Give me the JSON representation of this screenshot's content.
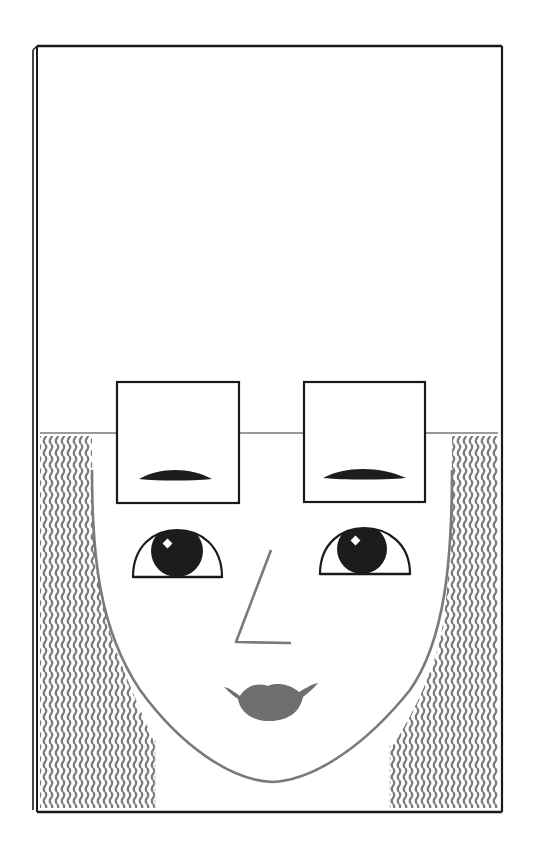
{
  "illustration": {
    "subject": "stylized face portrait",
    "colors": {
      "background": "#ffffff",
      "frame": "#1a1a1a",
      "hair": "#7a7a7a",
      "face_outline": "#7a7a7a",
      "lips": "#6f6f6f",
      "nose": "#7a7a7a",
      "iris": "#1c1c1c",
      "eyebrow": "#1c1c1c",
      "highlight": "#ffffff"
    },
    "parts": [
      "frame",
      "horizon-line",
      "left-eyebrow-box",
      "right-eyebrow-box",
      "left-eyebrow",
      "right-eyebrow",
      "left-eye",
      "right-eye",
      "nose",
      "lips",
      "face-outline",
      "hair-left",
      "hair-right"
    ]
  }
}
